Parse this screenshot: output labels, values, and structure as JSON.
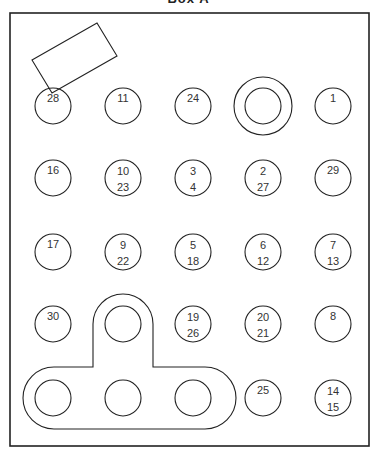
{
  "title": "Box A",
  "colors": {
    "stroke": "#222222",
    "text": "#333333",
    "background": "#ffffff"
  },
  "frame": {
    "x": 10,
    "y": 13,
    "w": 359,
    "h": 433
  },
  "slanted_rect": {
    "points": "32,60 97,23 117,56 52,93"
  },
  "circle_radius": 18,
  "circles": [
    {
      "cx": 53,
      "cy": 106,
      "labels": [
        "28"
      ]
    },
    {
      "cx": 123,
      "cy": 106,
      "labels": [
        "11"
      ]
    },
    {
      "cx": 193,
      "cy": 106,
      "labels": [
        "24"
      ]
    },
    {
      "cx": 333,
      "cy": 106,
      "labels": [
        "1"
      ]
    },
    {
      "cx": 53,
      "cy": 178,
      "labels": [
        "16"
      ]
    },
    {
      "cx": 123,
      "cy": 178,
      "labels": [
        "10",
        "23"
      ]
    },
    {
      "cx": 193,
      "cy": 178,
      "labels": [
        "3",
        "4"
      ]
    },
    {
      "cx": 263,
      "cy": 178,
      "labels": [
        "2",
        "27"
      ]
    },
    {
      "cx": 333,
      "cy": 178,
      "labels": [
        "29"
      ]
    },
    {
      "cx": 53,
      "cy": 252,
      "labels": [
        "17"
      ]
    },
    {
      "cx": 123,
      "cy": 252,
      "labels": [
        "9",
        "22"
      ]
    },
    {
      "cx": 193,
      "cy": 252,
      "labels": [
        "5",
        "18"
      ]
    },
    {
      "cx": 263,
      "cy": 252,
      "labels": [
        "6",
        "12"
      ]
    },
    {
      "cx": 333,
      "cy": 252,
      "labels": [
        "7",
        "13"
      ]
    },
    {
      "cx": 53,
      "cy": 324,
      "labels": [
        "30"
      ]
    },
    {
      "cx": 123,
      "cy": 324,
      "labels": []
    },
    {
      "cx": 193,
      "cy": 324,
      "labels": [
        "19",
        "26"
      ]
    },
    {
      "cx": 263,
      "cy": 324,
      "labels": [
        "20",
        "21"
      ]
    },
    {
      "cx": 333,
      "cy": 324,
      "labels": [
        "8"
      ]
    },
    {
      "cx": 53,
      "cy": 398,
      "labels": []
    },
    {
      "cx": 123,
      "cy": 398,
      "labels": []
    },
    {
      "cx": 193,
      "cy": 398,
      "labels": []
    },
    {
      "cx": 263,
      "cy": 398,
      "labels": [
        "25"
      ]
    },
    {
      "cx": 333,
      "cy": 398,
      "labels": [
        "14",
        "15"
      ]
    }
  ],
  "double_circle": {
    "cx": 263,
    "cy": 106,
    "r_outer": 29,
    "r_inner": 18
  },
  "t_shape_path": "M93,367 L93,324 A30,30 0 0 1 153,324 L153,367 L205,367 A31,31 0 0 1 205,429 L54,429 A31,31 0 0 1 54,367 Z"
}
